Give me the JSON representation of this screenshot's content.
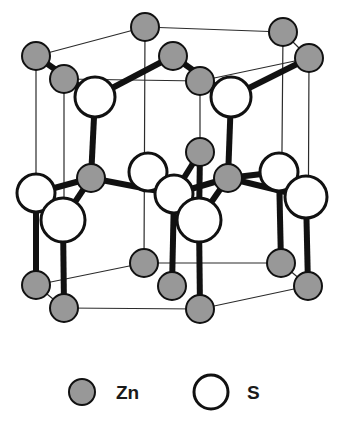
{
  "figure": {
    "background_color": "#ffffff",
    "width": 343,
    "height": 435
  },
  "style": {
    "zn_fill": "#989898",
    "zn_stroke": "#111111",
    "s_fill": "#ffffff",
    "s_stroke": "#111111",
    "bond_color": "#111111",
    "cell_edge_color": "#2b2b2b",
    "label_color": "#1a1a1a"
  },
  "legend": {
    "items": [
      {
        "key": "zn",
        "label": "Zn",
        "symbol": "filled-gray-circle",
        "fill": "#989898",
        "stroke": "#111111",
        "cx": 82,
        "cy": 392,
        "r": 13,
        "label_x": 116,
        "label_y": 399
      },
      {
        "key": "s",
        "label": "S",
        "symbol": "open-white-circle",
        "fill": "#ffffff",
        "stroke": "#111111",
        "cx": 211,
        "cy": 392,
        "r": 17,
        "label_x": 247,
        "label_y": 399
      }
    ]
  },
  "footer": {
    "caption": ""
  },
  "structure": {
    "lattice_type": "wurtzite",
    "compound": "ZnS",
    "atoms": [
      {
        "id": "zn-t1",
        "element": "Zn",
        "cx": 145,
        "cy": 27,
        "r": 14
      },
      {
        "id": "zn-t2",
        "element": "Zn",
        "cx": 283,
        "cy": 32,
        "r": 14
      },
      {
        "id": "zn-t3",
        "element": "Zn",
        "cx": 36,
        "cy": 56,
        "r": 14
      },
      {
        "id": "zn-t4",
        "element": "Zn",
        "cx": 173,
        "cy": 56,
        "r": 14
      },
      {
        "id": "zn-t5",
        "element": "Zn",
        "cx": 309,
        "cy": 58,
        "r": 14
      },
      {
        "id": "zn-t6",
        "element": "Zn",
        "cx": 64,
        "cy": 79,
        "r": 14
      },
      {
        "id": "zn-t7",
        "element": "Zn",
        "cx": 200,
        "cy": 81,
        "r": 14
      },
      {
        "id": "s-u1",
        "element": "S",
        "cx": 95,
        "cy": 97,
        "r": 20
      },
      {
        "id": "s-u2",
        "element": "S",
        "cx": 231,
        "cy": 97,
        "r": 20
      },
      {
        "id": "zn-m1",
        "element": "Zn",
        "cx": 200,
        "cy": 152,
        "r": 14
      },
      {
        "id": "s-m1",
        "element": "S",
        "cx": 148,
        "cy": 172,
        "r": 19
      },
      {
        "id": "s-m2",
        "element": "S",
        "cx": 279,
        "cy": 172,
        "r": 19
      },
      {
        "id": "zn-m2",
        "element": "Zn",
        "cx": 91,
        "cy": 178,
        "r": 14
      },
      {
        "id": "zn-m3",
        "element": "Zn",
        "cx": 228,
        "cy": 178,
        "r": 14
      },
      {
        "id": "s-m3",
        "element": "S",
        "cx": 36,
        "cy": 193,
        "r": 19
      },
      {
        "id": "s-m4",
        "element": "S",
        "cx": 174,
        "cy": 194,
        "r": 19
      },
      {
        "id": "s-m5",
        "element": "S",
        "cx": 306,
        "cy": 197,
        "r": 21
      },
      {
        "id": "s-m6",
        "element": "S",
        "cx": 63,
        "cy": 220,
        "r": 22
      },
      {
        "id": "s-m7",
        "element": "S",
        "cx": 199,
        "cy": 220,
        "r": 22
      },
      {
        "id": "zn-b1",
        "element": "Zn",
        "cx": 144,
        "cy": 263,
        "r": 14
      },
      {
        "id": "zn-b2",
        "element": "Zn",
        "cx": 281,
        "cy": 263,
        "r": 14
      },
      {
        "id": "zn-b3",
        "element": "Zn",
        "cx": 36,
        "cy": 285,
        "r": 14
      },
      {
        "id": "zn-b4",
        "element": "Zn",
        "cx": 172,
        "cy": 286,
        "r": 14
      },
      {
        "id": "zn-b5",
        "element": "Zn",
        "cx": 308,
        "cy": 286,
        "r": 14
      },
      {
        "id": "zn-b6",
        "element": "Zn",
        "cx": 64,
        "cy": 308,
        "r": 14
      },
      {
        "id": "zn-b7",
        "element": "Zn",
        "cx": 200,
        "cy": 309,
        "r": 14
      }
    ],
    "cell_edges": [
      {
        "from": "zn-t3",
        "to": "zn-t1"
      },
      {
        "from": "zn-t1",
        "to": "zn-t2"
      },
      {
        "from": "zn-t3",
        "to": "zn-t6"
      },
      {
        "from": "zn-t2",
        "to": "zn-t5"
      },
      {
        "from": "zn-t6",
        "to": "zn-t7"
      },
      {
        "from": "zn-t7",
        "to": "zn-t5"
      },
      {
        "from": "zn-b3",
        "to": "zn-b1"
      },
      {
        "from": "zn-b1",
        "to": "zn-b2"
      },
      {
        "from": "zn-b3",
        "to": "zn-b6"
      },
      {
        "from": "zn-b2",
        "to": "zn-b5"
      },
      {
        "from": "zn-b6",
        "to": "zn-b7"
      },
      {
        "from": "zn-b7",
        "to": "zn-b5"
      },
      {
        "from": "zn-t3",
        "to": "zn-b3"
      },
      {
        "from": "zn-t6",
        "to": "zn-b6"
      },
      {
        "from": "zn-t1",
        "to": "zn-b1"
      },
      {
        "from": "zn-t7",
        "to": "zn-b7"
      },
      {
        "from": "zn-t2",
        "to": "zn-b2"
      },
      {
        "from": "zn-t5",
        "to": "zn-b5"
      }
    ],
    "bonds": [
      {
        "from": "zn-t3",
        "to": "s-u1",
        "weight": "heavy"
      },
      {
        "from": "zn-t6",
        "to": "s-u1",
        "weight": "heavy"
      },
      {
        "from": "zn-t4",
        "to": "s-u1",
        "weight": "heavy"
      },
      {
        "from": "zn-t4",
        "to": "s-u2",
        "weight": "heavy"
      },
      {
        "from": "zn-t7",
        "to": "s-u2",
        "weight": "heavy"
      },
      {
        "from": "zn-t5",
        "to": "s-u2",
        "weight": "heavy"
      },
      {
        "from": "s-u1",
        "to": "zn-m2",
        "weight": "heavy"
      },
      {
        "from": "s-u2",
        "to": "zn-m3",
        "weight": "heavy"
      },
      {
        "from": "zn-m2",
        "to": "s-m3",
        "weight": "heavy"
      },
      {
        "from": "zn-m2",
        "to": "s-m6",
        "weight": "heavy"
      },
      {
        "from": "zn-m2",
        "to": "s-m4",
        "weight": "heavy"
      },
      {
        "from": "zn-m1",
        "to": "s-m4",
        "weight": "heavy"
      },
      {
        "from": "zn-m1",
        "to": "s-m7",
        "weight": "heavy"
      },
      {
        "from": "zn-m3",
        "to": "s-m4",
        "weight": "heavy"
      },
      {
        "from": "zn-m3",
        "to": "s-m7",
        "weight": "heavy"
      },
      {
        "from": "zn-m3",
        "to": "s-m2",
        "weight": "heavy"
      },
      {
        "from": "zn-m3",
        "to": "s-m5",
        "weight": "heavy"
      },
      {
        "from": "s-m3",
        "to": "zn-b3",
        "weight": "heavy"
      },
      {
        "from": "s-m6",
        "to": "zn-b6",
        "weight": "heavy"
      },
      {
        "from": "s-m4",
        "to": "zn-b4",
        "weight": "heavy"
      },
      {
        "from": "s-m7",
        "to": "zn-b7",
        "weight": "heavy"
      },
      {
        "from": "s-m5",
        "to": "zn-b5",
        "weight": "heavy"
      },
      {
        "from": "s-m2",
        "to": "zn-b2",
        "weight": "heavy"
      }
    ]
  }
}
